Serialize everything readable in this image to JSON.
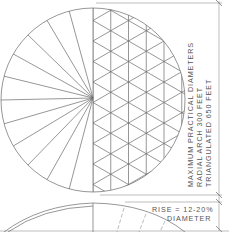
{
  "diagram": {
    "plan_view": {
      "left_half": "radial arch",
      "right_half": "triangulated"
    },
    "dimension_labels": {
      "line1": "MAXIMUM  PRACTICAL  DIAMETERS",
      "line2": "RADIAL  ARCH   300   FEET",
      "line3": "TRIANGULATED   650   FEET"
    },
    "rise_label": {
      "line1": "RISE = 12-20%",
      "line2": "DIAMETER"
    },
    "colors": {
      "line": "#6a6a6a",
      "text": "#555555",
      "background": "#ffffff"
    }
  }
}
